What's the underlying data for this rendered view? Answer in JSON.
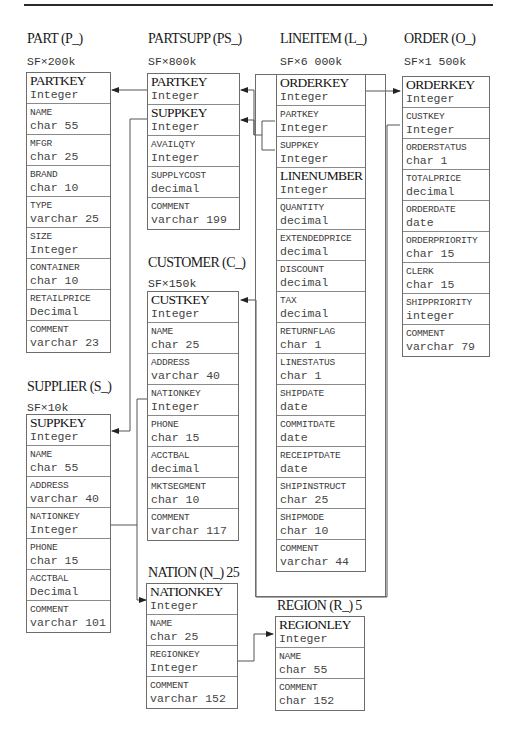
{
  "page": {
    "number": "..."
  },
  "tables": {
    "part": {
      "title": "PART (P_)",
      "scale": "SF×200k",
      "fields": [
        {
          "name": "PARTKEY",
          "type": "Integer",
          "key": true
        },
        {
          "name": "NAME",
          "type": "char 55",
          "key": false
        },
        {
          "name": "MFGR",
          "type": "char 25",
          "key": false
        },
        {
          "name": "BRAND",
          "type": "char 10",
          "key": false
        },
        {
          "name": "TYPE",
          "type": "varchar 25",
          "key": false
        },
        {
          "name": "SIZE",
          "type": "Integer",
          "key": false
        },
        {
          "name": "CONTAINER",
          "type": "char 10",
          "key": false
        },
        {
          "name": "RETAILPRICE",
          "type": "Decimal",
          "key": false
        },
        {
          "name": "COMMENT",
          "type": "varchar 23",
          "key": false
        }
      ]
    },
    "partsupp": {
      "title": "PARTSUPP (PS_)",
      "scale": "SF×800k",
      "fields": [
        {
          "name": "PARTKEY",
          "type": "Integer",
          "key": true
        },
        {
          "name": "SUPPKEY",
          "type": "Integer",
          "key": true
        },
        {
          "name": "AVAILQTY",
          "type": "Integer",
          "key": false
        },
        {
          "name": "SUPPLYCOST",
          "type": "decimal",
          "key": false
        },
        {
          "name": "COMMENT",
          "type": "varchar 199",
          "key": false
        }
      ]
    },
    "lineitem": {
      "title": "LINEITEM (L_)",
      "scale": "SF×6 000k",
      "fields": [
        {
          "name": "ORDERKEY",
          "type": "Integer",
          "key": true
        },
        {
          "name": "PARTKEY",
          "type": "Integer",
          "key": false
        },
        {
          "name": "SUPPKEY",
          "type": "Integer",
          "key": false
        },
        {
          "name": "LINENUMBER",
          "type": "Integer",
          "key": true
        },
        {
          "name": "QUANTITY",
          "type": "decimal",
          "key": false
        },
        {
          "name": "EXTENDEDPRICE",
          "type": "decimal",
          "key": false
        },
        {
          "name": "DISCOUNT",
          "type": "decimal",
          "key": false
        },
        {
          "name": "TAX",
          "type": "decimal",
          "key": false
        },
        {
          "name": "RETURNFLAG",
          "type": "char 1",
          "key": false
        },
        {
          "name": "LINESTATUS",
          "type": "char 1",
          "key": false
        },
        {
          "name": "SHIPDATE",
          "type": "date",
          "key": false
        },
        {
          "name": "COMMITDATE",
          "type": "date",
          "key": false
        },
        {
          "name": "RECEIPTDATE",
          "type": "date",
          "key": false
        },
        {
          "name": "SHIPINSTRUCT",
          "type": "char 25",
          "key": false
        },
        {
          "name": "SHIPMODE",
          "type": "char 10",
          "key": false
        },
        {
          "name": "COMMENT",
          "type": "varchar 44",
          "key": false
        }
      ]
    },
    "order": {
      "title": "ORDER (O_)",
      "scale": "SF×1 500k",
      "fields": [
        {
          "name": "ORDERKEY",
          "type": "Integer",
          "key": true
        },
        {
          "name": "CUSTKEY",
          "type": "Integer",
          "key": false
        },
        {
          "name": "ORDERSTATUS",
          "type": "char 1",
          "key": false
        },
        {
          "name": "TOTALPRICE",
          "type": "decimal",
          "key": false
        },
        {
          "name": "ORDERDATE",
          "type": "date",
          "key": false
        },
        {
          "name": "ORDERPRIORITY",
          "type": "char 15",
          "key": false
        },
        {
          "name": "CLERK",
          "type": "char 15",
          "key": false
        },
        {
          "name": "SHIPPRIORITY",
          "type": "integer",
          "key": false
        },
        {
          "name": "COMMENT",
          "type": "varchar 79",
          "key": false
        }
      ]
    },
    "customer": {
      "title": "CUSTOMER (C_)",
      "scale": "SF×150k",
      "fields": [
        {
          "name": "CUSTKEY",
          "type": "Integer",
          "key": true
        },
        {
          "name": "NAME",
          "type": "char 25",
          "key": false
        },
        {
          "name": "ADDRESS",
          "type": "varchar 40",
          "key": false
        },
        {
          "name": "NATIONKEY",
          "type": "Integer",
          "key": false
        },
        {
          "name": "PHONE",
          "type": "char 15",
          "key": false
        },
        {
          "name": "ACCTBAL",
          "type": "decimal",
          "key": false
        },
        {
          "name": "MKTSEGMENT",
          "type": "char 10",
          "key": false
        },
        {
          "name": "COMMENT",
          "type": "varchar 117",
          "key": false
        }
      ]
    },
    "supplier": {
      "title": "SUPPLIER (S_)",
      "scale": "SF×10k",
      "fields": [
        {
          "name": "SUPPKEY",
          "type": "Integer",
          "key": true
        },
        {
          "name": "NAME",
          "type": "char 55",
          "key": false
        },
        {
          "name": "ADDRESS",
          "type": "varchar 40",
          "key": false
        },
        {
          "name": "NATIONKEY",
          "type": "Integer",
          "key": false
        },
        {
          "name": "PHONE",
          "type": "char 15",
          "key": false
        },
        {
          "name": "ACCTBAL",
          "type": "Decimal",
          "key": false
        },
        {
          "name": "COMMENT",
          "type": "varchar 101",
          "key": false
        }
      ]
    },
    "nation": {
      "title": "NATION (N_) 25",
      "fields": [
        {
          "name": "NATIONKEY",
          "type": "Integer",
          "key": true
        },
        {
          "name": "NAME",
          "type": "char 25",
          "key": false
        },
        {
          "name": "REGIONKEY",
          "type": "Integer",
          "key": false
        },
        {
          "name": "COMMENT",
          "type": "varchar 152",
          "key": false
        }
      ]
    },
    "region": {
      "title": "REGION (R_) 5",
      "fields": [
        {
          "name": "REGIONLEY",
          "type": "Integer",
          "key": true
        },
        {
          "name": "NAME",
          "type": "char 55",
          "key": false
        },
        {
          "name": "COMMENT",
          "type": "char 152",
          "key": false
        }
      ]
    }
  },
  "relationships": [
    {
      "from": "PARTSUPP.PARTKEY",
      "to": "PART.PARTKEY"
    },
    {
      "from": "PARTSUPP.SUPPKEY",
      "to": "SUPPLIER.SUPPKEY"
    },
    {
      "from": "LINEITEM.PARTKEY/SUPPKEY",
      "to": "PARTSUPP.PARTKEY/SUPPKEY"
    },
    {
      "from": "LINEITEM.ORDERKEY",
      "to": "ORDER.ORDERKEY"
    },
    {
      "from": "ORDER.CUSTKEY",
      "to": "CUSTOMER.CUSTKEY"
    },
    {
      "from": "CUSTOMER.NATIONKEY",
      "to": "NATION.NATIONKEY"
    },
    {
      "from": "SUPPLIER.NATIONKEY",
      "to": "NATION.NATIONKEY"
    },
    {
      "from": "NATION.REGIONKEY",
      "to": "REGION.REGIONKEY"
    }
  ]
}
